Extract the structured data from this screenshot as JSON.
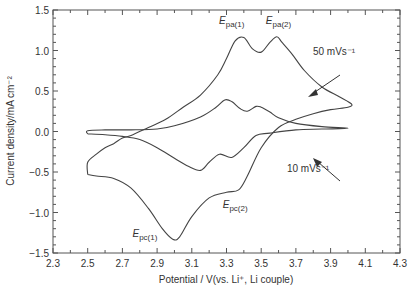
{
  "chart_data": {
    "type": "line",
    "title": "",
    "xlabel": "Potential / V(vs. Li⁺, Li couple)",
    "ylabel": "Current density/mA cm⁻²",
    "xlim": [
      2.3,
      4.3
    ],
    "ylim": [
      -1.5,
      1.5
    ],
    "x_ticks": [
      "2.3",
      "2.5",
      "2.7",
      "2.9",
      "3.1",
      "3.3",
      "3.5",
      "3.7",
      "3.9",
      "4.1",
      "4.3"
    ],
    "y_ticks": [
      "1.5",
      "1.0",
      "0.5",
      "0.0",
      "−0.5",
      "−1.0",
      "−1.5"
    ],
    "grid": false,
    "legend": null,
    "series": [
      {
        "name": "50 mVs⁻¹",
        "points": [
          [
            2.5,
            -0.53
          ],
          [
            2.55,
            -0.55
          ],
          [
            2.65,
            -0.58
          ],
          [
            2.75,
            -0.7
          ],
          [
            2.85,
            -0.95
          ],
          [
            2.93,
            -1.2
          ],
          [
            2.99,
            -1.33
          ],
          [
            3.03,
            -1.3
          ],
          [
            3.1,
            -1.05
          ],
          [
            3.2,
            -0.82
          ],
          [
            3.3,
            -0.75
          ],
          [
            3.37,
            -0.72
          ],
          [
            3.42,
            -0.55
          ],
          [
            3.5,
            -0.2
          ],
          [
            3.6,
            0.05
          ],
          [
            3.7,
            0.15
          ],
          [
            3.8,
            0.22
          ],
          [
            3.9,
            0.27
          ],
          [
            4.0,
            0.3
          ],
          [
            4.02,
            0.34
          ],
          [
            3.95,
            0.43
          ],
          [
            3.85,
            0.55
          ],
          [
            3.75,
            0.75
          ],
          [
            3.68,
            0.95
          ],
          [
            3.62,
            1.1
          ],
          [
            3.59,
            1.17
          ],
          [
            3.55,
            1.1
          ],
          [
            3.5,
            0.98
          ],
          [
            3.45,
            1.02
          ],
          [
            3.4,
            1.16
          ],
          [
            3.35,
            1.12
          ],
          [
            3.3,
            0.9
          ],
          [
            3.25,
            0.7
          ],
          [
            3.15,
            0.45
          ],
          [
            3.05,
            0.3
          ],
          [
            2.95,
            0.15
          ],
          [
            2.85,
            0.05
          ],
          [
            2.75,
            -0.05
          ],
          [
            2.7,
            -0.08
          ],
          [
            2.65,
            -0.15
          ],
          [
            2.6,
            -0.2
          ],
          [
            2.55,
            -0.28
          ],
          [
            2.5,
            -0.38
          ],
          [
            2.5,
            -0.53
          ]
        ]
      },
      {
        "name": "10 mVs⁻¹",
        "points": [
          [
            2.5,
            -0.03
          ],
          [
            2.6,
            -0.04
          ],
          [
            2.7,
            -0.06
          ],
          [
            2.8,
            -0.1
          ],
          [
            2.9,
            -0.2
          ],
          [
            3.0,
            -0.33
          ],
          [
            3.08,
            -0.43
          ],
          [
            3.15,
            -0.48
          ],
          [
            3.2,
            -0.38
          ],
          [
            3.26,
            -0.28
          ],
          [
            3.33,
            -0.32
          ],
          [
            3.4,
            -0.2
          ],
          [
            3.47,
            -0.05
          ],
          [
            3.55,
            -0.02
          ],
          [
            3.7,
            0.02
          ],
          [
            3.85,
            0.03
          ],
          [
            4.0,
            0.04
          ],
          [
            3.85,
            0.06
          ],
          [
            3.7,
            0.1
          ],
          [
            3.6,
            0.17
          ],
          [
            3.55,
            0.24
          ],
          [
            3.5,
            0.3
          ],
          [
            3.47,
            0.31
          ],
          [
            3.42,
            0.25
          ],
          [
            3.38,
            0.28
          ],
          [
            3.33,
            0.37
          ],
          [
            3.29,
            0.39
          ],
          [
            3.24,
            0.3
          ],
          [
            3.15,
            0.18
          ],
          [
            3.0,
            0.07
          ],
          [
            2.9,
            0.03
          ],
          [
            2.75,
            0.02
          ],
          [
            2.6,
            0.02
          ],
          [
            2.5,
            0.01
          ],
          [
            2.5,
            -0.03
          ]
        ]
      }
    ],
    "annotations": [
      {
        "id": "epa1",
        "main": "E",
        "sub": "pa(1)",
        "x": 3.33,
        "y": 1.33
      },
      {
        "id": "epa2",
        "main": "E",
        "sub": "pa(2)",
        "x": 3.6,
        "y": 1.33
      },
      {
        "id": "epc1",
        "main": "E",
        "sub": "pc(1)",
        "x": 2.83,
        "y": -1.3
      },
      {
        "id": "epc2",
        "main": "E",
        "sub": "pc(2)",
        "x": 3.35,
        "y": -0.95
      },
      {
        "id": "l50",
        "text": "50 mVs⁻¹",
        "x": 3.92,
        "y": 0.95
      },
      {
        "id": "l10",
        "text": "10 mVs⁻¹",
        "x": 3.77,
        "y": -0.5
      }
    ]
  }
}
